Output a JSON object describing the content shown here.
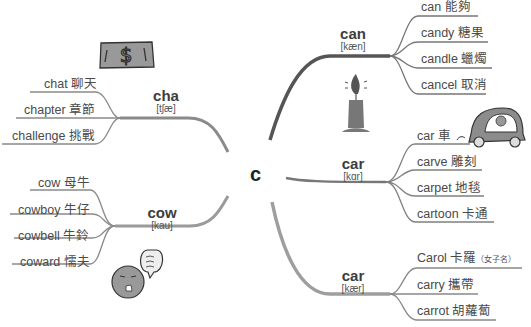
{
  "center": {
    "letter": "c"
  },
  "branches": {
    "cha": {
      "word": "cha",
      "phonetic": "[tʃæ]",
      "items": [
        {
          "label": "chat 聊天"
        },
        {
          "label": "chapter 章節"
        },
        {
          "label": "challenge 挑戰"
        }
      ],
      "illustration": "dollar-bill"
    },
    "cow": {
      "word": "cow",
      "phonetic": "[kau]",
      "items": [
        {
          "label": "cow 母牛"
        },
        {
          "label": "cowboy 牛仔"
        },
        {
          "label": "cowbell 牛鈴"
        },
        {
          "label": "coward 懦夫"
        }
      ],
      "illustration": "scared-face-with-speech-bubble"
    },
    "can": {
      "word": "can",
      "phonetic": "[kæn]",
      "items": [
        {
          "label": "can 能夠"
        },
        {
          "label": "candy 糖果"
        },
        {
          "label": "candle 蠟燭"
        },
        {
          "label": "cancel 取消"
        }
      ],
      "illustration": "candle"
    },
    "car1": {
      "word": "car",
      "phonetic": "[kɑr]",
      "items": [
        {
          "label": "car 車"
        },
        {
          "label": "carve 雕刻"
        },
        {
          "label": "carpet 地毯"
        },
        {
          "label": "cartoon 卡通"
        }
      ],
      "illustration": "car-with-driver"
    },
    "car2": {
      "word": "car",
      "phonetic": "[kær]",
      "items": [
        {
          "label": "Carol 卡羅",
          "note": "（女子名）"
        },
        {
          "label": "carry 攜帶"
        },
        {
          "label": "carrot 胡蘿蔔"
        }
      ]
    }
  },
  "colors": {
    "branch_dark": "#555555",
    "branch_mid": "#8a8a8a",
    "branch_light": "#9e9e9e",
    "leaf_line": "#808080",
    "illustration_fill": "#8c8c8c"
  }
}
